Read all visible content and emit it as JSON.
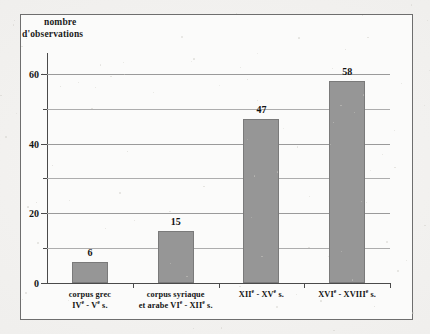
{
  "figure": {
    "background_color": "#f2f1ef",
    "frame_color": "#6e6e6e",
    "plot_background": "#fbfbfa"
  },
  "chart_data": {
    "type": "bar",
    "title": "",
    "ylabel_line1": "nombre",
    "ylabel_line2": "d'observations",
    "xlabel": "",
    "ylim": [
      0,
      66
    ],
    "grid": true,
    "legend": "none",
    "bar_color": "#969696",
    "bar_edge_color": "#7a7a7a",
    "y_major_ticks": [
      0,
      20,
      40,
      60
    ],
    "y_minor_ticks": [
      10,
      30,
      50
    ],
    "y_tick_labels": [
      "0",
      "20",
      "40",
      "60"
    ],
    "categories": [
      "corpus grec IVe - Ve s.",
      "corpus syriaque et arabe VIe - XIIe s.",
      "XIIe - XVe s.",
      "XVIe - XVIIIe s."
    ],
    "category_label_lines": [
      [
        "corpus grec",
        "IV|e| - V|e| s."
      ],
      [
        "corpus syriaque",
        "et arabe VI|e| - XII|e| s."
      ],
      [
        "XII|e| - XV|e| s.",
        ""
      ],
      [
        "XVI|e| - XVIII|e| s.",
        ""
      ]
    ],
    "values": [
      6,
      15,
      47,
      58
    ],
    "value_labels": [
      "6",
      "15",
      "47",
      "58"
    ]
  }
}
